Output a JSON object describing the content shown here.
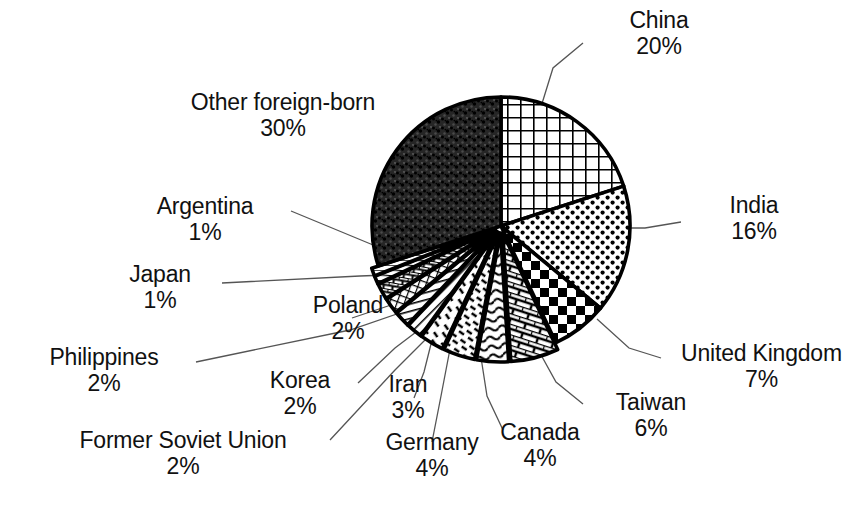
{
  "chart_data": {
    "type": "pie",
    "title": "",
    "subtitle": "",
    "xlabel": "",
    "ylabel": "",
    "units": "percent",
    "legend_position": "none",
    "labels_style": "outside-with-leader-lines",
    "grid": false,
    "start_angle_deg": 0,
    "direction": "clockwise",
    "categories": [
      "China",
      "India",
      "United Kingdom",
      "Taiwan",
      "Canada",
      "Germany",
      "Iran",
      "Korea",
      "Philippines",
      "Former Soviet Union",
      "Poland",
      "Japan",
      "Argentina",
      "Other foreign-born"
    ],
    "values": [
      20,
      16,
      7,
      6,
      4,
      4,
      3,
      2,
      2,
      2,
      2,
      1,
      1,
      30
    ],
    "slices": [
      {
        "name": "China",
        "value": 20,
        "pct_text": "20%",
        "pattern": "grid",
        "exploded": false
      },
      {
        "name": "India",
        "value": 16,
        "pct_text": "16%",
        "pattern": "dots",
        "exploded": false
      },
      {
        "name": "United Kingdom",
        "value": 7,
        "pct_text": "7%",
        "pattern": "checker",
        "exploded": false
      },
      {
        "name": "Taiwan",
        "value": 6,
        "pct_text": "6%",
        "pattern": "brick",
        "exploded": true
      },
      {
        "name": "Canada",
        "value": 4,
        "pct_text": "4%",
        "pattern": "wave",
        "exploded": true
      },
      {
        "name": "Germany",
        "value": 4,
        "pct_text": "4%",
        "pattern": "dash-diagonal",
        "exploded": true
      },
      {
        "name": "Iran",
        "value": 3,
        "pct_text": "3%",
        "pattern": "dash-sparse",
        "exploded": true
      },
      {
        "name": "Korea",
        "value": 2,
        "pct_text": "2%",
        "pattern": "diagonal-dense",
        "exploded": true
      },
      {
        "name": "Philippines",
        "value": 2,
        "pct_text": "2%",
        "pattern": "vertical-lines",
        "exploded": true
      },
      {
        "name": "Former Soviet Union",
        "value": 2,
        "pct_text": "2%",
        "pattern": "crosshatch-fine",
        "exploded": true
      },
      {
        "name": "Poland",
        "value": 2,
        "pct_text": "2%",
        "pattern": "brick-fine",
        "exploded": true
      },
      {
        "name": "Japan",
        "value": 1,
        "pct_text": "1%",
        "pattern": "horizontal-fine",
        "exploded": true
      },
      {
        "name": "Argentina",
        "value": 1,
        "pct_text": "1%",
        "pattern": "solid-light",
        "exploded": true
      },
      {
        "name": "Other foreign-born",
        "value": 30,
        "pct_text": "30%",
        "pattern": "speckle-dark",
        "exploded": false
      }
    ]
  },
  "labels": {
    "china": {
      "name": "China",
      "pct": "20%"
    },
    "other": {
      "name": "Other foreign-born",
      "pct": "30%"
    },
    "india": {
      "name": "India",
      "pct": "16%"
    },
    "argentina": {
      "name": "Argentina",
      "pct": "1%"
    },
    "japan": {
      "name": "Japan",
      "pct": "1%"
    },
    "poland": {
      "name": "Poland",
      "pct": "2%"
    },
    "philippines": {
      "name": "Philippines",
      "pct": "2%"
    },
    "korea": {
      "name": "Korea",
      "pct": "2%"
    },
    "iran": {
      "name": "Iran",
      "pct": "3%"
    },
    "uk": {
      "name": "United Kingdom",
      "pct": "7%"
    },
    "taiwan": {
      "name": "Taiwan",
      "pct": "6%"
    },
    "canada": {
      "name": "Canada",
      "pct": "4%"
    },
    "germany": {
      "name": "Germany",
      "pct": "4%"
    },
    "fsu": {
      "name": "Former Soviet Union",
      "pct": "2%"
    }
  },
  "colors": {
    "background": "#ffffff",
    "ink": "#000000",
    "leader_line": "#555555",
    "dark_slice": "#2b2b2b"
  }
}
